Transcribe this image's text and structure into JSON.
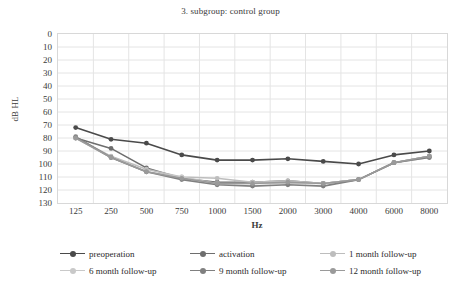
{
  "chart_data": {
    "type": "line",
    "title": "3. subgroup: control group",
    "xlabel": "Hz",
    "ylabel": "dB HL",
    "categories": [
      "125",
      "250",
      "500",
      "750",
      "1000",
      "1500",
      "2000",
      "3000",
      "4000",
      "6000",
      "8000"
    ],
    "ylim": [
      0,
      130
    ],
    "y_inverted": true,
    "yticks": [
      "0",
      "10",
      "20",
      "30",
      "40",
      "50",
      "60",
      "70",
      "80",
      "90",
      "100",
      "110",
      "120",
      "130"
    ],
    "grid": true,
    "legend_position": "bottom",
    "series": [
      {
        "name": "preoperation",
        "color": "#4a4a4a",
        "values": [
          72,
          81,
          84,
          93,
          97,
          97,
          96,
          98,
          100,
          93,
          90
        ]
      },
      {
        "name": "activation",
        "color": "#6e6e6e",
        "values": [
          80,
          88,
          103,
          111,
          114,
          114,
          113,
          115,
          112,
          99,
          94
        ]
      },
      {
        "name": "1 month follow-up",
        "color": "#bdbdbd",
        "values": [
          80,
          94,
          104,
          110,
          111,
          114,
          113,
          115,
          112,
          99,
          94
        ]
      },
      {
        "name": "6 month follow-up",
        "color": "#c9c9c9",
        "values": [
          80,
          95,
          106,
          110,
          115,
          115,
          115,
          115,
          112,
          99,
          95
        ]
      },
      {
        "name": "9 month follow-up",
        "color": "#808080",
        "values": [
          79,
          95,
          106,
          112,
          116,
          117,
          116,
          117,
          112,
          99,
          95
        ]
      },
      {
        "name": "12 month follow-up",
        "color": "#9a9a9a",
        "values": [
          80,
          95,
          106,
          111,
          115,
          115,
          114,
          115,
          112,
          99,
          94
        ]
      }
    ]
  }
}
